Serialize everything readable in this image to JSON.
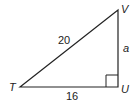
{
  "figure": {
    "type": "right-triangle",
    "vertices": {
      "T": {
        "label": "T"
      },
      "U": {
        "label": "U"
      },
      "V": {
        "label": "V"
      }
    },
    "sides": {
      "hypotenuse_TV": {
        "label": "20"
      },
      "base_TU": {
        "label": "16"
      },
      "leg_UV": {
        "label": "a"
      }
    },
    "right_angle_at": "U",
    "stroke_color": "#222222"
  }
}
